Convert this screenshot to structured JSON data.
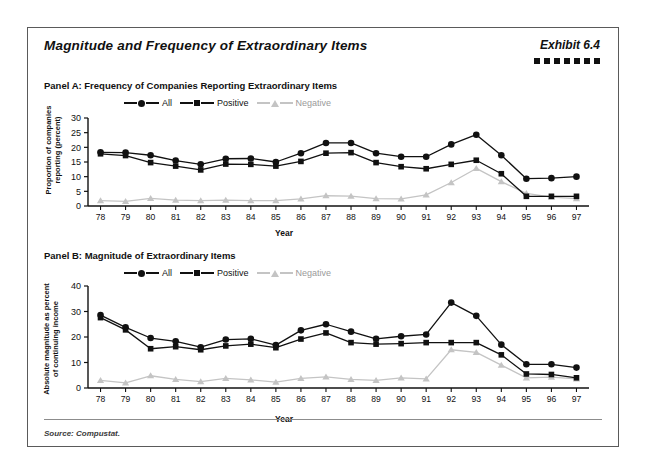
{
  "exhibit": {
    "title": "Magnitude and Frequency of Extraordinary Items",
    "number": "Exhibit 6.4",
    "dot_count": 7,
    "source": "Source: Compustat."
  },
  "legend": {
    "all": "All",
    "positive": "Positive",
    "negative": "Negative"
  },
  "colors": {
    "dark": "#111111",
    "gray": "#c4c4c4",
    "gray_text": "#9a9a9a",
    "frame": "#5a5a5a"
  },
  "chart_data": [
    {
      "type": "line",
      "panel": "Panel A",
      "title": "Panel A: Frequency of Companies Reporting Extraordinary Items",
      "xlabel": "Year",
      "ylabel": "Proportion of companies reporting (percent)",
      "ylabel_line1": "Proportion of companies",
      "ylabel_line2": "reporting (percent)",
      "ylim": [
        0,
        30
      ],
      "yticks": [
        0,
        5,
        10,
        15,
        20,
        25,
        30
      ],
      "grid": false,
      "legend_position": "top-left",
      "categories": [
        "78",
        "79",
        "80",
        "81",
        "82",
        "83",
        "84",
        "85",
        "86",
        "87",
        "88",
        "89",
        "90",
        "91",
        "92",
        "93",
        "94",
        "95",
        "96",
        "97"
      ],
      "series": [
        {
          "name": "All",
          "marker": "circle",
          "color": "#111111",
          "values": [
            18.3,
            18.2,
            17.3,
            15.5,
            14.2,
            16.1,
            16.2,
            15.0,
            18.0,
            21.5,
            21.5,
            18.0,
            16.8,
            16.8,
            21.0,
            24.3,
            17.3,
            9.3,
            9.5,
            10.0
          ]
        },
        {
          "name": "Positive",
          "marker": "square",
          "color": "#111111",
          "values": [
            17.8,
            17.2,
            14.8,
            13.6,
            12.3,
            14.3,
            14.2,
            13.6,
            15.2,
            18.0,
            18.2,
            14.8,
            13.4,
            12.7,
            14.2,
            15.6,
            11.0,
            3.3,
            3.3,
            3.3
          ]
        },
        {
          "name": "Negative",
          "marker": "triangle",
          "color": "#c4c4c4",
          "values": [
            1.8,
            1.6,
            2.6,
            2.0,
            1.8,
            2.0,
            1.8,
            1.8,
            2.4,
            3.5,
            3.4,
            2.5,
            2.4,
            3.8,
            8.0,
            12.8,
            8.3,
            4.3,
            3.0,
            2.5
          ]
        }
      ]
    },
    {
      "type": "line",
      "panel": "Panel B",
      "title": "Panel B: Magnitude of Extraordinary Items",
      "xlabel": "Year",
      "ylabel": "Absolute magnitude as percent of continuing income",
      "ylabel_line1": "Absolute magnitude as percent",
      "ylabel_line2": "of continuing income",
      "ylim": [
        0,
        40
      ],
      "yticks": [
        0,
        10,
        20,
        30,
        40
      ],
      "grid": false,
      "legend_position": "top-left",
      "categories": [
        "78",
        "79",
        "80",
        "81",
        "82",
        "83",
        "84",
        "85",
        "86",
        "87",
        "88",
        "89",
        "90",
        "91",
        "92",
        "93",
        "94",
        "95",
        "96",
        "97"
      ],
      "series": [
        {
          "name": "All",
          "marker": "circle",
          "color": "#111111",
          "values": [
            28.6,
            23.8,
            19.6,
            18.3,
            16.0,
            19.0,
            19.3,
            16.8,
            22.6,
            25.0,
            22.1,
            19.3,
            20.3,
            21.0,
            33.5,
            28.3,
            17.0,
            9.3,
            9.3,
            8.0
          ]
        },
        {
          "name": "Positive",
          "marker": "square",
          "color": "#111111",
          "values": [
            27.6,
            22.8,
            15.4,
            16.2,
            15.0,
            16.5,
            17.2,
            15.8,
            19.2,
            21.6,
            17.8,
            17.2,
            17.4,
            17.8,
            17.8,
            17.8,
            13.0,
            5.5,
            5.3,
            4.0
          ]
        },
        {
          "name": "Negative",
          "marker": "triangle",
          "color": "#c4c4c4",
          "values": [
            3.0,
            2.0,
            4.8,
            3.4,
            2.5,
            3.8,
            3.2,
            2.3,
            3.8,
            4.4,
            3.4,
            3.0,
            4.0,
            3.6,
            15.0,
            14.0,
            9.0,
            4.0,
            4.3,
            3.6
          ]
        }
      ]
    }
  ]
}
